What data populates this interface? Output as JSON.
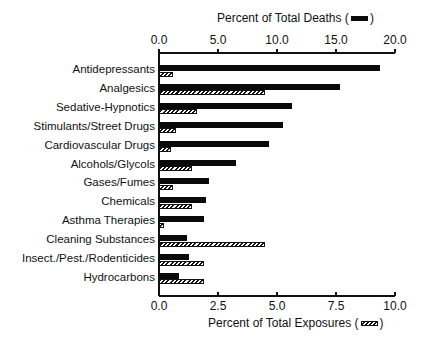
{
  "chart_data": {
    "type": "bar",
    "orientation": "horizontal",
    "categories": [
      "Antidepressants",
      "Analgesics",
      "Sedative-Hypnotics",
      "Stimulants/Street Drugs",
      "Cardiovascular Drugs",
      "Alcohols/Glycols",
      "Gases/Fumes",
      "Chemicals",
      "Asthma Therapies",
      "Cleaning Substances",
      "Insect./Pest./Rodenticides",
      "Hydrocarbons"
    ],
    "series": [
      {
        "name": "Percent of Total Deaths",
        "axis": "top",
        "style": "solid-black",
        "values": [
          18.7,
          15.3,
          11.3,
          10.5,
          9.3,
          6.5,
          4.2,
          4.0,
          3.8,
          2.4,
          2.5,
          1.7
        ]
      },
      {
        "name": "Percent of Total Exposures",
        "axis": "bottom",
        "style": "hatched",
        "values": [
          0.6,
          4.5,
          1.6,
          0.7,
          0.5,
          1.4,
          0.6,
          1.4,
          0.2,
          4.5,
          1.9,
          1.9
        ]
      }
    ],
    "top_axis": {
      "label": "Percent of Total Deaths",
      "ticks": [
        "0.0",
        "5.0",
        "10.0",
        "15.0",
        "20.0"
      ],
      "range": [
        0,
        20
      ]
    },
    "bottom_axis": {
      "label": "Percent of Total Exposures",
      "ticks": [
        "0.0",
        "2.5",
        "5.0",
        "7.5",
        "10.0"
      ],
      "range": [
        0,
        10
      ]
    },
    "title": "",
    "grid": false,
    "legend_position": "inline-in-axis-titles"
  },
  "labels": {
    "top_axis_title": "Percent of Total Deaths",
    "bottom_axis_title": "Percent of Total Exposures",
    "paren_open": "(",
    "paren_close": ")"
  }
}
